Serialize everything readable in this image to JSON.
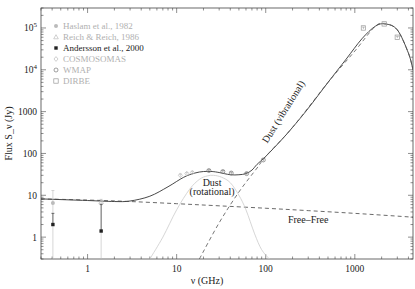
{
  "chart_data": {
    "type": "line",
    "title": "",
    "xlabel": "ν (GHz)",
    "ylabel": "Flux S_ν (Jy)",
    "xscale": "log",
    "yscale": "log",
    "xlim": [
      0.3,
      4500
    ],
    "ylim": [
      0.3,
      300000
    ],
    "x_ticks": [
      {
        "value": 1,
        "label": "1"
      },
      {
        "value": 10,
        "label": "10"
      },
      {
        "value": 100,
        "label": "100"
      },
      {
        "value": 1000,
        "label": "1000"
      }
    ],
    "y_ticks": [
      {
        "value": 1,
        "label": "1"
      },
      {
        "value": 10,
        "label": "10"
      },
      {
        "value": 100,
        "label": "100"
      },
      {
        "value": 1000,
        "label": "1000"
      },
      {
        "value": 10000,
        "label": "10^4"
      },
      {
        "value": 100000,
        "label": "10^5"
      }
    ],
    "grid": false,
    "legend_position": "top-left",
    "legend": [
      {
        "label": "Haslam et al., 1982",
        "marker": "filled-circle",
        "color": "#bbbbbb"
      },
      {
        "label": "Reich & Reich, 1986",
        "marker": "triangle",
        "color": "#bbbbbb"
      },
      {
        "label": "Andersson et al., 2000",
        "marker": "filled-square",
        "color": "#222222"
      },
      {
        "label": "COSMOSOMAS",
        "marker": "diamond",
        "color": "#bbbbbb"
      },
      {
        "label": "WMAP",
        "marker": "open-circle",
        "color": "#777777"
      },
      {
        "label": "DIRBE",
        "marker": "open-square",
        "color": "#999999"
      }
    ],
    "series": [
      {
        "name": "Total model",
        "style": "solid",
        "color": "#333333",
        "x": [
          0.3,
          1,
          2,
          3,
          5,
          8,
          12,
          16,
          20,
          25,
          30,
          40,
          50,
          60,
          70,
          80,
          100,
          150,
          200,
          300,
          500,
          800,
          1200,
          1700,
          2200,
          3000,
          4000,
          4500
        ],
        "y": [
          8.2,
          7.5,
          7.1,
          7.3,
          9.5,
          16,
          27,
          34,
          37,
          37,
          35,
          31,
          31,
          33,
          40,
          55,
          85,
          210,
          420,
          1200,
          5000,
          18000,
          55000,
          110000,
          125000,
          90000,
          25000,
          10000
        ]
      },
      {
        "name": "Free-Free",
        "style": "dashed",
        "color": "#444444",
        "x": [
          0.3,
          1,
          3,
          10,
          30,
          100,
          300,
          1000,
          4500
        ],
        "y": [
          8.2,
          7.7,
          7.1,
          6.3,
          5.6,
          4.9,
          4.3,
          3.7,
          3.0
        ]
      },
      {
        "name": "Dust (rotational)",
        "style": "solid",
        "color": "#cccccc",
        "x": [
          5,
          7,
          10,
          14,
          18,
          22,
          26,
          32,
          40,
          50,
          60,
          75,
          90,
          110
        ],
        "y": [
          0.3,
          1.0,
          4.5,
          14,
          24,
          29,
          30,
          27,
          20,
          10,
          4.5,
          1.2,
          0.5,
          0.3
        ]
      },
      {
        "name": "Dust (vibrational)",
        "style": "dashed",
        "color": "#555555",
        "x": [
          18,
          30,
          50,
          80,
          100,
          200,
          500,
          1000,
          1700,
          2200,
          3000,
          4000,
          4500
        ],
        "y": [
          0.3,
          2.2,
          12,
          45,
          85,
          420,
          5000,
          28000,
          110000,
          125000,
          90000,
          25000,
          10000
        ]
      }
    ],
    "points": [
      {
        "dataset": "Haslam et al., 1982",
        "x": 0.408,
        "y": 6.5,
        "err_low": 0.3,
        "err_high": 13
      },
      {
        "dataset": "Reich & Reich, 1986",
        "x": 1.42,
        "y": 7.0,
        "err_low": 0.3,
        "err_high": 8
      },
      {
        "dataset": "Andersson et al., 2000",
        "x": 0.408,
        "y": 2.0,
        "err_low": 2.0,
        "err_high": 3.7
      },
      {
        "dataset": "Andersson et al., 2000",
        "x": 1.42,
        "y": 1.4,
        "err_low": 1.4,
        "err_high": 6.0
      },
      {
        "dataset": "COSMOSOMAS",
        "x": 11,
        "y": 30,
        "err_low": 28,
        "err_high": 32
      },
      {
        "dataset": "COSMOSOMAS",
        "x": 13,
        "y": 33,
        "err_low": 31,
        "err_high": 35
      },
      {
        "dataset": "COSMOSOMAS",
        "x": 15,
        "y": 35,
        "err_low": 33,
        "err_high": 37
      },
      {
        "dataset": "WMAP",
        "x": 23,
        "y": 39,
        "err_low": 37,
        "err_high": 41
      },
      {
        "dataset": "WMAP",
        "x": 33,
        "y": 37,
        "err_low": 35,
        "err_high": 39
      },
      {
        "dataset": "WMAP",
        "x": 41,
        "y": 34,
        "err_low": 32,
        "err_high": 36
      },
      {
        "dataset": "WMAP",
        "x": 61,
        "y": 33,
        "err_low": 31,
        "err_high": 35
      },
      {
        "dataset": "WMAP",
        "x": 94,
        "y": 70,
        "err_low": 65,
        "err_high": 75
      },
      {
        "dataset": "DIRBE",
        "x": 1250,
        "y": 100000,
        "err_low": 95000,
        "err_high": 105000
      },
      {
        "dataset": "DIRBE",
        "x": 2140,
        "y": 125000,
        "err_low": 120000,
        "err_high": 130000
      },
      {
        "dataset": "DIRBE",
        "x": 3000,
        "y": 60000,
        "err_low": 57000,
        "err_high": 63000
      }
    ],
    "annotations": [
      {
        "text": "Dust",
        "x": 25,
        "y": 17
      },
      {
        "text": "(rotational)",
        "x": 25,
        "y": 10
      },
      {
        "text": "Dust (vibrational)",
        "x": 170,
        "y": 900,
        "rotation_deg": -58
      },
      {
        "text": "Free–Free",
        "x": 300,
        "y": 2.2
      }
    ]
  }
}
